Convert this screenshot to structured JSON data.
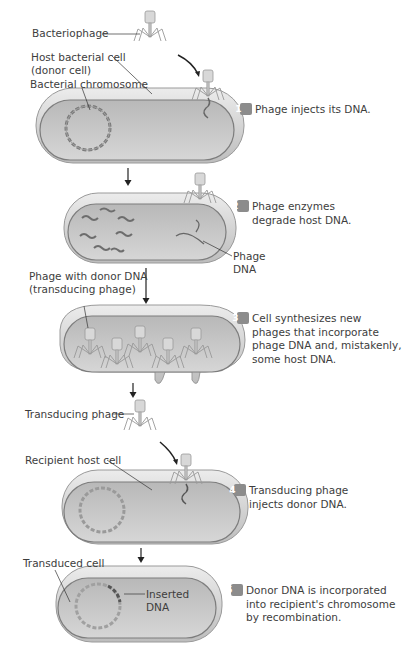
{
  "labels": {
    "bacteriophage": "Bacteriophage",
    "host_cell_line1": "Host bacterial cell",
    "host_cell_line2": "(donor cell)",
    "bacterial_chromosome": "Bacterial chromosome",
    "phage_dna_line1": "Phage",
    "phage_dna_line2": "DNA",
    "phage_donor_line1": "Phage with donor DNA",
    "phage_donor_line2": "(transducing phage)",
    "transducing_phage": "Transducing phage",
    "recipient_host_cell": "Recipient host cell",
    "transduced_cell": "Transduced cell",
    "inserted_dna_line1": "Inserted",
    "inserted_dna_line2": "DNA"
  },
  "steps": [
    {
      "number": "1",
      "lines": [
        "Phage injects its DNA."
      ]
    },
    {
      "number": "2",
      "lines": [
        "Phage enzymes",
        "degrade host DNA."
      ]
    },
    {
      "number": "3",
      "lines": [
        "Cell synthesizes new",
        "phages that incorporate",
        "phage DNA and, mistakenly,",
        "some host DNA."
      ]
    },
    {
      "number": "4",
      "lines": [
        "Transducing phage",
        "injects donor DNA."
      ]
    },
    {
      "number": "5",
      "lines": [
        "Donor DNA is incorporated",
        "into recipient's chromosome",
        "by recombination."
      ]
    }
  ],
  "colors": {
    "cell_fill": "#c9c9c9",
    "cell_rim": "#e4e4e4",
    "cell_outline": "#8a8a8a",
    "dna": "#7a7a7a",
    "badge": "#8c8c8c",
    "text": "#3d3d3d"
  }
}
